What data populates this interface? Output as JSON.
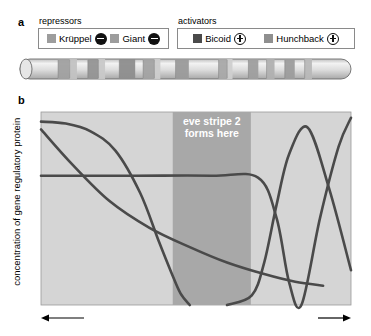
{
  "panel_a": {
    "letter": "a",
    "groups": [
      {
        "title": "repressors",
        "entries": [
          {
            "name": "Krüppel",
            "swatch": "krueppel",
            "sign": "minus",
            "sign_glyph": "−"
          },
          {
            "name": "Giant",
            "swatch": "giant",
            "sign": "minus",
            "sign_glyph": "−"
          }
        ]
      },
      {
        "title": "activators",
        "entries": [
          {
            "name": "Bicoid",
            "swatch": "bicoid",
            "sign": "plus",
            "sign_glyph": "+"
          },
          {
            "name": "Hunchback",
            "swatch": "hunchback",
            "sign": "plus",
            "sign_glyph": "+"
          }
        ]
      }
    ],
    "embryo": {
      "name": "drosophila-embryo-stripes",
      "body_color": "#d8d8d8",
      "stripe_color": "#9a9a9a",
      "outline_color": "#6b6b6b",
      "stripes": [
        {
          "x": 0.115,
          "w": 0.035,
          "shade": "#a0a0a0"
        },
        {
          "x": 0.15,
          "w": 0.022,
          "shade": "#c2c2c2"
        },
        {
          "x": 0.205,
          "w": 0.032,
          "shade": "#949494"
        },
        {
          "x": 0.237,
          "w": 0.02,
          "shade": "#c8c8c8"
        },
        {
          "x": 0.3,
          "w": 0.048,
          "shade": "#8d8d8d"
        },
        {
          "x": 0.372,
          "w": 0.034,
          "shade": "#a2a2a2"
        },
        {
          "x": 0.406,
          "w": 0.018,
          "shade": "#cccccc"
        },
        {
          "x": 0.47,
          "w": 0.04,
          "shade": "#9a9a9a"
        },
        {
          "x": 0.6,
          "w": 0.026,
          "shade": "#a8a8a8"
        },
        {
          "x": 0.626,
          "w": 0.016,
          "shade": "#cfcfcf"
        },
        {
          "x": 0.69,
          "w": 0.03,
          "shade": "#9e9e9e"
        },
        {
          "x": 0.745,
          "w": 0.024,
          "shade": "#b0b0b0"
        },
        {
          "x": 0.8,
          "w": 0.03,
          "shade": "#9c9c9c"
        },
        {
          "x": 0.86,
          "w": 0.022,
          "shade": "#b8b8b8"
        }
      ]
    }
  },
  "panel_b": {
    "letter": "b",
    "annotation": {
      "line1": "eve stripe 2",
      "line2": "forms here"
    },
    "xaxis": {
      "left_label": "anterior",
      "center_label": "position along embryo",
      "right_label": "posterior"
    },
    "yaxis": {
      "label": "concentration of gene regulatory protein"
    }
  },
  "chart_data": {
    "type": "line",
    "title": "",
    "xlabel": "position along embryo",
    "ylabel": "concentration of gene regulatory protein",
    "xlim": [
      0,
      1
    ],
    "ylim": [
      0,
      1
    ],
    "grid": false,
    "legend_position": "top (panel a)",
    "plot_bg": "#d5d5d5",
    "band_bg": "#a8a8a8",
    "curve_color": "#4a4a4a",
    "annotation_text": "eve stripe 2 forms here",
    "stripe_band": {
      "x_start": 0.425,
      "x_end": 0.677,
      "label": "eve stripe 2 forms here"
    },
    "series": [
      {
        "name": "Bicoid",
        "role": "activator",
        "description": "high anterior, sigmoid decline, reaches zero just before the stripe band",
        "x": [
          0.0,
          0.08,
          0.16,
          0.24,
          0.32,
          0.38,
          0.42,
          0.45,
          0.48
        ],
        "y": [
          0.95,
          0.94,
          0.9,
          0.8,
          0.58,
          0.33,
          0.17,
          0.06,
          0.0
        ]
      },
      {
        "name": "Hunchback",
        "role": "activator",
        "description": "steep near-linear decay from anterior, flattening to a low plateau at posterior",
        "x": [
          0.0,
          0.1,
          0.22,
          0.35,
          0.48,
          0.6,
          0.72,
          0.82,
          0.91
        ],
        "y": [
          0.91,
          0.73,
          0.54,
          0.4,
          0.3,
          0.22,
          0.16,
          0.12,
          0.1
        ]
      },
      {
        "name": "Giant",
        "role": "repressor",
        "description": "flat mid-level plateau across anterior and stripe band, sharp V-shaped dip to zero just past the band, then steep rise to maximum at posterior",
        "x": [
          0.0,
          0.3,
          0.55,
          0.7,
          0.76,
          0.8,
          0.84,
          0.9,
          0.96,
          1.0
        ],
        "y": [
          0.67,
          0.67,
          0.67,
          0.66,
          0.45,
          0.12,
          0.0,
          0.45,
          0.82,
          0.97
        ]
      },
      {
        "name": "Krüppel",
        "role": "repressor",
        "description": "zero through the anterior, rises sharply after the stripe band to a posterior peak then declines",
        "x": [
          0.6,
          0.68,
          0.72,
          0.76,
          0.8,
          0.86,
          0.93,
          1.0
        ],
        "y": [
          0.0,
          0.05,
          0.22,
          0.52,
          0.78,
          0.92,
          0.6,
          0.18
        ]
      }
    ]
  }
}
